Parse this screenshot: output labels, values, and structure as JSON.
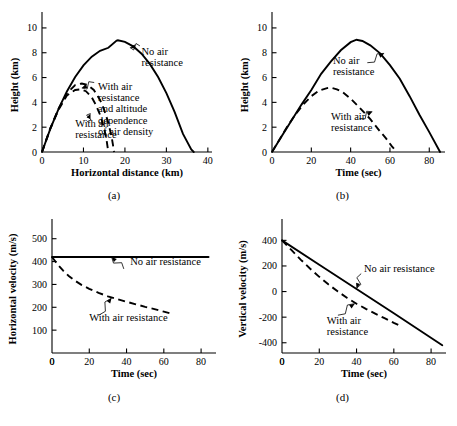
{
  "figure": {
    "title": "",
    "panel_labels": [
      "(a)",
      "(b)",
      "(c)",
      "(d)"
    ]
  },
  "chart_data": [
    {
      "id": "a",
      "type": "line",
      "panel_label": "(a)",
      "title": "",
      "xlabel": "Horizontal distance (km)",
      "ylabel": "Height (km)",
      "xlim": [
        0,
        41
      ],
      "ylim": [
        0,
        10.8
      ],
      "xticks": [
        0,
        10,
        20,
        30,
        40
      ],
      "yticks": [
        0,
        2,
        4,
        6,
        8,
        10
      ],
      "grid": false,
      "legend_position": "inline-annotations",
      "annotations": [
        {
          "text": "No air resistance",
          "lines": [
            "No air",
            "resistance"
          ],
          "x": 24.0,
          "y": 7.8
        },
        {
          "text": "With air resistance and altitude dependence of air density",
          "lines": [
            "With air",
            "resistance",
            "and altitude",
            "dependence",
            "of air density"
          ],
          "x": 13.5,
          "y": 5.0
        },
        {
          "text": "With air resistance",
          "lines": [
            "With air",
            "resistance"
          ],
          "x": 8.0,
          "y": 2.0
        }
      ],
      "series": [
        {
          "name": "No air resistance",
          "style": "solid",
          "x": [
            0,
            2,
            4,
            6,
            8,
            10,
            12,
            14,
            16,
            18,
            18.3,
            20,
            22,
            24,
            26,
            28,
            30,
            32,
            34,
            36,
            36.6
          ],
          "y": [
            0,
            1.86,
            3.48,
            4.88,
            6.04,
            6.98,
            7.68,
            8.16,
            8.4,
            8.98,
            9.0,
            8.88,
            8.52,
            7.92,
            7.1,
            6.04,
            4.74,
            3.22,
            1.46,
            0.2,
            0
          ]
        },
        {
          "name": "With air resistance and altitude dependence of air density",
          "style": "dashed",
          "x": [
            0,
            2,
            4,
            6,
            8,
            9.6,
            11,
            12.5,
            14,
            15,
            16,
            16.8,
            17.4
          ],
          "y": [
            0,
            1.9,
            3.5,
            4.72,
            5.4,
            5.52,
            5.4,
            5.0,
            4.2,
            3.4,
            2.35,
            1.2,
            0
          ]
        },
        {
          "name": "With air resistance",
          "style": "dashed",
          "x": [
            0,
            2,
            4,
            6,
            8,
            9.4,
            10.6,
            12,
            13,
            14,
            15,
            15.6,
            16.0
          ],
          "y": [
            0,
            1.88,
            3.42,
            4.55,
            5.0,
            5.05,
            4.9,
            4.4,
            3.8,
            3.0,
            1.9,
            0.9,
            0
          ]
        }
      ]
    },
    {
      "id": "b",
      "type": "line",
      "panel_label": "(b)",
      "title": "",
      "xlabel": "Time (sec)",
      "ylabel": "Height (km)",
      "xlim": [
        0,
        88
      ],
      "ylim": [
        0,
        10.8
      ],
      "xticks": [
        0,
        20,
        40,
        60,
        80
      ],
      "yticks": [
        0,
        2,
        4,
        6,
        8,
        10
      ],
      "grid": false,
      "legend_position": "inline-annotations",
      "annotations": [
        {
          "text": "No air resistance",
          "lines": [
            "No air",
            "resistance"
          ],
          "x": 31.0,
          "y": 7.1
        },
        {
          "text": "With air resistance",
          "lines": [
            "With air",
            "resistance"
          ],
          "x": 30.0,
          "y": 2.6
        }
      ],
      "series": [
        {
          "name": "No air resistance",
          "style": "solid",
          "x": [
            0,
            5,
            10,
            15,
            20,
            25,
            30,
            35,
            40,
            43,
            46,
            50,
            55,
            60,
            65,
            70,
            75,
            80,
            85.5
          ],
          "y": [
            0,
            1.28,
            2.55,
            3.82,
            5.0,
            6.3,
            7.3,
            8.2,
            8.85,
            9.05,
            8.95,
            8.6,
            7.95,
            7.0,
            5.9,
            4.5,
            3.0,
            1.6,
            0
          ]
        },
        {
          "name": "With air resistance",
          "style": "dashed",
          "x": [
            0,
            4,
            8,
            12,
            16,
            20,
            24,
            28,
            30,
            33,
            36,
            40,
            45,
            50,
            55,
            58,
            61,
            63.5
          ],
          "y": [
            0,
            1.05,
            2.1,
            3.05,
            3.85,
            4.5,
            4.95,
            5.15,
            5.18,
            5.05,
            4.82,
            4.3,
            3.5,
            2.65,
            1.65,
            1.1,
            0.45,
            0
          ]
        }
      ]
    },
    {
      "id": "c",
      "type": "line",
      "panel_label": "(c)",
      "title": "",
      "xlabel": "Time (sec)",
      "ylabel": "Horizontal velocity (m/s)",
      "xlim": [
        0,
        88
      ],
      "ylim": [
        0,
        560
      ],
      "xticks": [
        0,
        20,
        40,
        60,
        80
      ],
      "yticks": [
        100,
        200,
        300,
        400,
        500
      ],
      "grid": false,
      "legend_position": "inline-annotations",
      "annotations": [
        {
          "text": "No air resistance",
          "lines": [
            "No air resistance"
          ],
          "x": 42.0,
          "y": 383
        },
        {
          "text": "With air resistance",
          "lines": [
            "With air resistance"
          ],
          "x": 20.0,
          "y": 140
        }
      ],
      "series": [
        {
          "name": "No air resistance",
          "style": "solid",
          "x": [
            0,
            20,
            40,
            60,
            84
          ],
          "y": [
            420,
            420,
            420,
            420,
            420
          ]
        },
        {
          "name": "With air resistance",
          "style": "dashed",
          "x": [
            0,
            3,
            6,
            9,
            12,
            16,
            20,
            25,
            30,
            35,
            40,
            45,
            50,
            55,
            60,
            65
          ],
          "y": [
            420,
            388,
            360,
            337,
            318,
            297,
            281,
            263,
            248,
            236,
            224,
            213,
            202,
            192,
            181,
            170
          ]
        }
      ]
    },
    {
      "id": "d",
      "type": "line",
      "panel_label": "(d)",
      "title": "",
      "xlabel": "Time (sec)",
      "ylabel": "Vertical velocity (m/s)",
      "xlim": [
        0,
        88
      ],
      "ylim": [
        -480,
        520
      ],
      "xticks": [
        0,
        20,
        40,
        60,
        80
      ],
      "yticks": [
        400,
        200,
        0,
        -200,
        -400
      ],
      "ytick_labels": [
        "400",
        "200",
        "0",
        "-200",
        "-400"
      ],
      "grid": false,
      "legend_position": "inline-annotations",
      "annotations": [
        {
          "text": "No air resistance",
          "lines": [
            "No air resistance"
          ],
          "x": 44.0,
          "y": 150
        },
        {
          "text": "With air resistance",
          "lines": [
            "With air",
            "resistance"
          ],
          "x": 24.0,
          "y": -250
        }
      ],
      "series": [
        {
          "name": "No air resistance",
          "style": "solid",
          "x": [
            0,
            20,
            40,
            60,
            86
          ],
          "y": [
            400,
            210,
            20,
            -170,
            -420
          ]
        },
        {
          "name": "With air resistance",
          "style": "dashed",
          "x": [
            0,
            5,
            10,
            15,
            20,
            25,
            30,
            35,
            40,
            45,
            50,
            55,
            60,
            64
          ],
          "y": [
            400,
            325,
            250,
            180,
            115,
            55,
            0,
            -50,
            -95,
            -135,
            -172,
            -208,
            -245,
            -272
          ]
        }
      ]
    }
  ]
}
